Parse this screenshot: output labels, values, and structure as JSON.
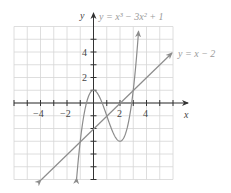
{
  "chart_data": {
    "type": "line",
    "title": "",
    "xlabel": "x",
    "ylabel": "y",
    "xlim": [
      -6,
      6
    ],
    "ylim": [
      -6,
      6
    ],
    "grid": true,
    "x_ticks": [
      -4,
      -2,
      2,
      4
    ],
    "y_ticks": [
      2,
      4
    ],
    "x_tick_labels": [
      "−4",
      "−2",
      "2",
      "4"
    ],
    "y_tick_labels": [
      "2",
      "4"
    ],
    "series": [
      {
        "name": "y = x³ − 3x² + 1",
        "function": "x^3 - 3x^2 + 1",
        "x_range": [
          -1.27,
          3.4
        ],
        "key_points": [
          [
            0,
            1
          ],
          [
            2,
            -3
          ]
        ],
        "color": "#8c8c8c"
      },
      {
        "name": "y = x − 2",
        "function": "x - 2",
        "x_range": [
          -4,
          6
        ],
        "key_points": [
          [
            -4,
            -6
          ],
          [
            6,
            4
          ]
        ],
        "color": "#8c8c8c"
      }
    ],
    "legend": "inline labels at curve ends"
  },
  "labels": {
    "x_axis": "x",
    "y_axis": "y",
    "cubic_label": "y = x³ − 3x² + 1",
    "line_label": "y = x − 2",
    "tick_neg4": "−4",
    "tick_neg2": "−2",
    "tick_2x": "2",
    "tick_4x": "4",
    "tick_2y": "2",
    "tick_4y": "4"
  }
}
